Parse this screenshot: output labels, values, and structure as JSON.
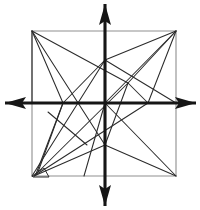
{
  "figure": {
    "background_color": "#ffffff",
    "width": 200,
    "height": 210
  },
  "colors": {
    "frame": "#8f8f8f",
    "web": "#2b2b2b",
    "axis": "#161616",
    "background": "#ffffff"
  },
  "axes": {
    "origin": {
      "x": 105,
      "y": 103
    },
    "stroke_width": 3.1,
    "vertical": {
      "label": "y-axis",
      "x": 105,
      "top_tip_y": 4,
      "bottom_tip_y": 206,
      "arrowheads": "both"
    },
    "horizontal": {
      "label": "x-axis",
      "y": 103,
      "left_tip_x": 5,
      "right_tip_x": 196,
      "arrowheads": "both"
    },
    "arrowheads": [
      {
        "name": "arrowhead-up",
        "points": "105,4 99,25 105,21 111,25"
      },
      {
        "name": "arrowhead-down",
        "points": "105,206 99,185 105,189 111,185"
      },
      {
        "name": "arrowhead-left",
        "points": "5,103 26,97 22,103 26,109"
      },
      {
        "name": "arrowhead-right",
        "points": "196,103 175,97 179,103 175,109"
      }
    ]
  },
  "square_frame": {
    "label": "bounding square",
    "corners": {
      "top_left": {
        "x": 32,
        "y": 31
      },
      "top_right": {
        "x": 176,
        "y": 31
      },
      "bottom_right": {
        "x": 176,
        "y": 176
      },
      "bottom_left": {
        "x": 32,
        "y": 176
      }
    },
    "path": "M32,31 L176,31 L176,176 L32,176 Z"
  },
  "nodes": [
    {
      "id": "TL",
      "name": "corner-top-left",
      "x": 32,
      "y": 31
    },
    {
      "id": "TR",
      "name": "corner-top-right",
      "x": 176,
      "y": 31
    },
    {
      "id": "BR",
      "name": "corner-bottom-right",
      "x": 176,
      "y": 176
    },
    {
      "id": "BL",
      "name": "corner-bottom-left",
      "x": 32,
      "y": 176
    },
    {
      "id": "O",
      "name": "origin",
      "x": 105,
      "y": 103
    },
    {
      "id": "N1",
      "name": "node-upper-axis",
      "x": 105,
      "y": 60
    },
    {
      "id": "N2",
      "name": "node-upper-right",
      "x": 128,
      "y": 83
    },
    {
      "id": "N3",
      "name": "node-left-axis",
      "x": 63,
      "y": 103
    },
    {
      "id": "N4",
      "name": "node-right-axis",
      "x": 148,
      "y": 103
    },
    {
      "id": "N5",
      "name": "node-lower-left",
      "x": 87,
      "y": 145
    },
    {
      "id": "N6",
      "name": "node-lower-center",
      "x": 105,
      "y": 145
    },
    {
      "id": "N7",
      "name": "node-top-axis-crossing",
      "x": 105,
      "y": 31
    },
    {
      "id": "N8",
      "name": "node-bottom-axis-crossing",
      "x": 105,
      "y": 176
    },
    {
      "id": "N9",
      "name": "node-left-edge-crossing",
      "x": 32,
      "y": 103
    },
    {
      "id": "N10",
      "name": "node-right-edge-crossing",
      "x": 176,
      "y": 103
    }
  ],
  "web_lines": [
    {
      "name": "line-tl-to-n2",
      "x1": 32,
      "y1": 31,
      "x2": 128,
      "y2": 83
    },
    {
      "name": "line-tl-to-n6",
      "x1": 32,
      "y1": 31,
      "x2": 105,
      "y2": 145
    },
    {
      "name": "line-tl-to-n3",
      "x1": 32,
      "y1": 31,
      "x2": 63,
      "y2": 103
    },
    {
      "name": "line-n3-to-bl",
      "x1": 63,
      "y1": 103,
      "x2": 38,
      "y2": 172
    },
    {
      "name": "line-tr-to-n1",
      "x1": 176,
      "y1": 31,
      "x2": 105,
      "y2": 60
    },
    {
      "name": "line-n1-to-n3",
      "x1": 105,
      "y1": 60,
      "x2": 63,
      "y2": 103
    },
    {
      "name": "line-n3-to-n5-ext",
      "x1": 63,
      "y1": 103,
      "x2": 36,
      "y2": 174
    },
    {
      "name": "line-tr-to-n2",
      "x1": 176,
      "y1": 31,
      "x2": 128,
      "y2": 83
    },
    {
      "name": "line-tr-to-n4",
      "x1": 176,
      "y1": 31,
      "x2": 148,
      "y2": 103
    },
    {
      "name": "line-tr-to-origin",
      "x1": 176,
      "y1": 31,
      "x2": 105,
      "y2": 103
    },
    {
      "name": "line-n2-to-n6",
      "x1": 128,
      "y1": 83,
      "x2": 105,
      "y2": 145
    },
    {
      "name": "line-n2-to-bl-long",
      "x1": 128,
      "y1": 83,
      "x2": 34,
      "y2": 176
    },
    {
      "name": "line-n4-to-bl",
      "x1": 148,
      "y1": 103,
      "x2": 34,
      "y2": 176
    },
    {
      "name": "line-n6-to-bl",
      "x1": 105,
      "y1": 145,
      "x2": 34,
      "y2": 176
    },
    {
      "name": "line-n6-to-br",
      "x1": 105,
      "y1": 145,
      "x2": 176,
      "y2": 176
    },
    {
      "name": "line-origin-to-br",
      "x1": 105,
      "y1": 103,
      "x2": 176,
      "y2": 176
    },
    {
      "name": "line-origin-to-n5",
      "x1": 105,
      "y1": 103,
      "x2": 84,
      "y2": 176
    },
    {
      "name": "line-n1-to-br-diag",
      "x1": 105,
      "y1": 60,
      "x2": 176,
      "y2": 103
    },
    {
      "name": "line-n2-to-n4",
      "x1": 128,
      "y1": 83,
      "x2": 148,
      "y2": 103
    },
    {
      "name": "line-tl-to-n9",
      "x1": 32,
      "y1": 31,
      "x2": 32,
      "y2": 103
    },
    {
      "name": "line-n5-to-n3-cross",
      "x1": 87,
      "y1": 145,
      "x2": 48,
      "y2": 112
    },
    {
      "name": "line-bl-to-n6-up",
      "x1": 32,
      "y1": 176,
      "x2": 105,
      "y2": 60
    }
  ],
  "corner_notch": {
    "name": "bottom-left-notch",
    "description": "small quadrilateral detail at the bottom-left corner",
    "path": "M32,176 L44,168 L49,177 L33,177 Z"
  }
}
